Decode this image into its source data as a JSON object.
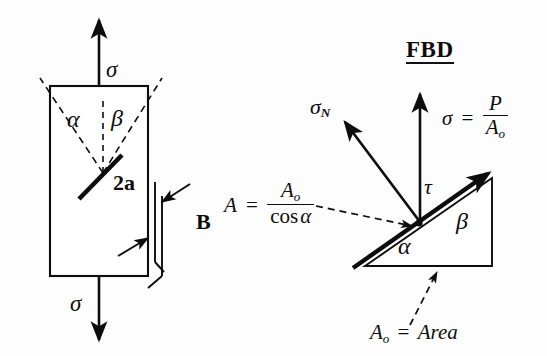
{
  "figure": {
    "background_color": "#fdfdfd",
    "ink_color": "#0d0d0d"
  },
  "left_panel": {
    "name": "cracked-plate-diagram",
    "stress_top_label": "σ",
    "stress_bottom_label": "σ",
    "angle_alpha_label": "α",
    "angle_beta_label": "β",
    "crack_length_label": "2a",
    "thickness_label": "B"
  },
  "right_panel": {
    "name": "free-body-diagram",
    "title": "FBD",
    "normal_stress_label": "σ",
    "normal_stress_subscript": "N",
    "shear_stress_label": "τ",
    "angle_alpha_label": "α",
    "angle_beta_label": "β",
    "equation_sigma": {
      "lhs": "σ",
      "equals": "=",
      "numerator": "P",
      "denominator_symbol": "A",
      "denominator_subscript": "o"
    },
    "equation_area": {
      "lhs": "A",
      "equals": "=",
      "numerator_symbol": "A",
      "numerator_subscript": "o",
      "denominator": "cos",
      "denominator_angle": "α"
    },
    "area_note": {
      "symbol": "A",
      "subscript": "o",
      "equals": "=",
      "value": "Area"
    }
  }
}
